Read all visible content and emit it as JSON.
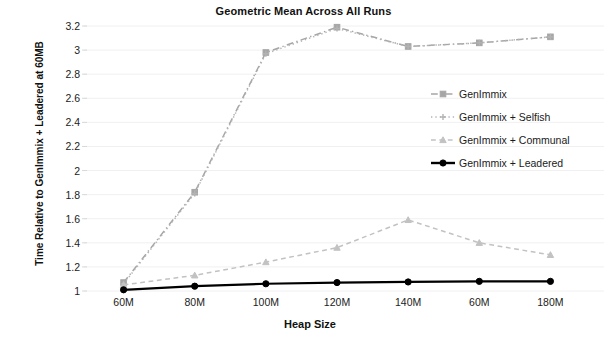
{
  "chart_data": {
    "type": "line",
    "title": "Geometric Mean Across All Runs",
    "xlabel": "Heap Size",
    "ylabel": "Time Relative to GenImmix + Leadered at 60MB",
    "categories": [
      "60M",
      "80M",
      "100M",
      "120M",
      "140M",
      "60M",
      "180M"
    ],
    "ytick_labels": [
      "3.2",
      "3",
      "2.8",
      "2.6",
      "2.4",
      "2.2",
      "2",
      "1.8",
      "1.6",
      "1.4",
      "1.2",
      "1"
    ],
    "ytick_values": [
      3.2,
      3.0,
      2.8,
      2.6,
      2.4,
      2.2,
      2.0,
      1.8,
      1.6,
      1.4,
      1.2,
      1.0
    ],
    "ylim": [
      1.0,
      3.2
    ],
    "grid": false,
    "legend_position": "right-inside",
    "series": [
      {
        "name": "GenImmix",
        "color": "#a6a6a6",
        "line_style": "dashdot",
        "marker": "square",
        "values": [
          1.07,
          1.82,
          2.98,
          3.19,
          3.03,
          3.06,
          3.11
        ]
      },
      {
        "name": "GenImmix + Selfish",
        "color": "#b3b3b3",
        "line_style": "dotted",
        "marker": "plus",
        "values": [
          1.06,
          1.81,
          2.97,
          3.18,
          3.03,
          3.06,
          3.11
        ]
      },
      {
        "name": "GenImmix + Communal",
        "color": "#c2c2c2",
        "line_style": "dashed",
        "marker": "triangle",
        "values": [
          1.05,
          1.13,
          1.24,
          1.36,
          1.59,
          1.4,
          1.3
        ]
      },
      {
        "name": "GenImmix + Leadered",
        "color": "#000000",
        "line_style": "solid",
        "marker": "circle",
        "values": [
          1.01,
          1.04,
          1.06,
          1.07,
          1.075,
          1.08,
          1.08
        ]
      }
    ]
  }
}
